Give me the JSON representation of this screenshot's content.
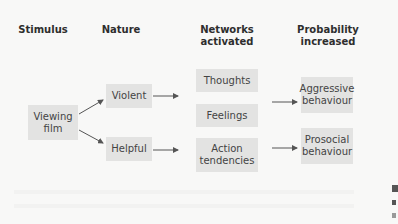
{
  "diagram": {
    "columns": {
      "stimulus": "Stimulus",
      "nature": "Nature",
      "networks": "Networks\nactivated",
      "probability": "Probability\nincreased"
    },
    "nodes": {
      "viewing_film": "Viewing\nfilm",
      "violent": "Violent",
      "helpful": "Helpful",
      "thoughts": "Thoughts",
      "feelings": "Feelings",
      "action_tendencies": "Action\ntendencies",
      "aggressive_behaviour": "Aggressive\nbehaviour",
      "prosocial_behaviour": "Prosocial\nbehaviour"
    },
    "edges": [
      {
        "from": "viewing_film",
        "to": "violent"
      },
      {
        "from": "viewing_film",
        "to": "helpful"
      },
      {
        "from": "violent",
        "to": "networks"
      },
      {
        "from": "helpful",
        "to": "networks"
      },
      {
        "from": "networks",
        "to": "aggressive_behaviour"
      },
      {
        "from": "networks",
        "to": "prosocial_behaviour"
      }
    ],
    "colors": {
      "background": "#f8f8f7",
      "box_fill": "#e3e3e2",
      "text": "#3a3a3a",
      "arrow": "#555555"
    }
  }
}
